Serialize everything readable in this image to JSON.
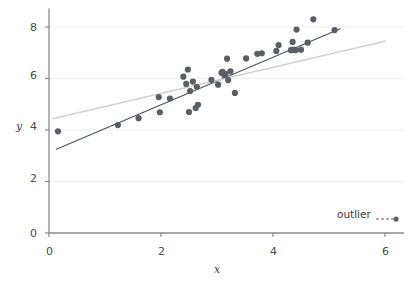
{
  "chart_data": {
    "type": "scatter",
    "title": "",
    "subtitle": "",
    "xlabel": "x",
    "ylabel": "y",
    "xlim": [
      0,
      6.2
    ],
    "ylim": [
      0,
      8.6
    ],
    "xticks": [
      0,
      2,
      4,
      6
    ],
    "yticks": [
      0,
      2,
      4,
      6,
      8
    ],
    "xticklabels": [
      "0",
      "2",
      "4",
      "6"
    ],
    "yticklabels": [
      "0",
      "2",
      "4",
      "6",
      "8"
    ],
    "grid": true,
    "grid_axis": "y",
    "legend": {
      "position": "lower-right",
      "entries": [
        {
          "label": "outlier",
          "marker": "circle",
          "linestyle": "dashed",
          "color": "#5a5f66"
        }
      ]
    },
    "series": [
      {
        "name": "observations",
        "type": "scatter",
        "marker": "circle",
        "marker_size": 5,
        "color": "#5a5f66",
        "points": [
          [
            0.16,
            3.95
          ],
          [
            1.23,
            4.19
          ],
          [
            1.6,
            4.46
          ],
          [
            1.96,
            5.28
          ],
          [
            1.98,
            4.69
          ],
          [
            2.16,
            5.22
          ],
          [
            2.4,
            6.07
          ],
          [
            2.45,
            5.79
          ],
          [
            2.48,
            6.35
          ],
          [
            2.5,
            4.7
          ],
          [
            2.52,
            5.51
          ],
          [
            2.57,
            5.88
          ],
          [
            2.62,
            4.85
          ],
          [
            2.64,
            5.68
          ],
          [
            2.66,
            4.98
          ],
          [
            2.9,
            5.95
          ],
          [
            3.02,
            5.76
          ],
          [
            3.08,
            6.22
          ],
          [
            3.1,
            6.26
          ],
          [
            3.13,
            6.13
          ],
          [
            3.15,
            6.18
          ],
          [
            3.18,
            6.77
          ],
          [
            3.2,
            5.94
          ],
          [
            3.24,
            6.28
          ],
          [
            3.32,
            5.44
          ],
          [
            3.52,
            6.78
          ],
          [
            3.72,
            6.96
          ],
          [
            3.8,
            6.98
          ],
          [
            4.06,
            7.07
          ],
          [
            4.1,
            7.3
          ],
          [
            4.32,
            7.1
          ],
          [
            4.35,
            7.42
          ],
          [
            4.37,
            7.12
          ],
          [
            4.4,
            7.1
          ],
          [
            4.42,
            7.9
          ],
          [
            4.5,
            7.12
          ],
          [
            4.62,
            7.39
          ],
          [
            4.72,
            8.3
          ],
          [
            5.1,
            7.88
          ]
        ]
      }
    ],
    "lines": [
      {
        "name": "fit-line-dark",
        "color": "#4f555c",
        "width": 1.2,
        "style": "solid",
        "x": [
          0.13,
          5.2
        ],
        "y": [
          3.25,
          7.93
        ]
      },
      {
        "name": "fit-line-light",
        "color": "#d2d2d2",
        "width": 1.6,
        "style": "solid",
        "x": [
          0.06,
          6.0
        ],
        "y": [
          4.44,
          7.45
        ]
      }
    ]
  },
  "axes": {
    "x_title": "x",
    "y_title": "y",
    "x_tick_labels": [
      "0",
      "2",
      "4",
      "6"
    ],
    "y_tick_labels": [
      "0",
      "2",
      "4",
      "6",
      "8"
    ]
  },
  "legend": {
    "label": "outlier"
  },
  "colors": {
    "marker": "#5a5f66",
    "dark_line": "#4f555c",
    "light_line": "#d2d2d2",
    "axis": "#8a8a8a",
    "grid": "#f0eeee",
    "text": "#3c3c3c"
  }
}
